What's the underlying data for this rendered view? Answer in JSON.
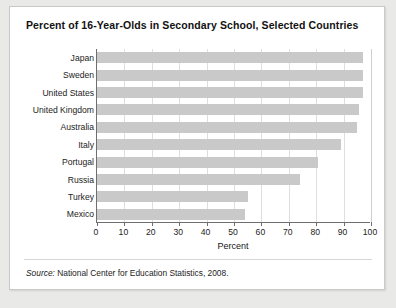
{
  "card": {
    "title": "Percent of 16-Year-Olds in Secondary School, Selected Countries",
    "source_label": "Source:",
    "source_text": " National Center for Education Statistics, 2008."
  },
  "colors": {
    "bar_fill": "#c9c9c9",
    "axis": "#6e6e6e",
    "gridline": "#dedede",
    "card_background": "#ffffff",
    "page_background": "#e9e9e7",
    "text": "#1c1c1c"
  },
  "chart_data": {
    "type": "bar",
    "orientation": "horizontal",
    "title": "Percent of 16-Year-Olds in Secondary School, Selected Countries",
    "xlabel": "Percent",
    "ylabel": "",
    "xlim": [
      0,
      100
    ],
    "xticks": [
      0,
      10,
      20,
      30,
      40,
      50,
      60,
      70,
      80,
      90,
      100
    ],
    "xticklabels": [
      "0",
      "10",
      "20",
      "30",
      "40",
      "50",
      "60",
      "70",
      "80",
      "90",
      "100"
    ],
    "grid": "vertical",
    "legend": "none",
    "categories": [
      "Japan",
      "Sweden",
      "United States",
      "United Kingdom",
      "Australia",
      "Italy",
      "Portugal",
      "Russia",
      "Turkey",
      "Mexico"
    ],
    "values": [
      97,
      97,
      97,
      95.5,
      95,
      89,
      80.5,
      74,
      55,
      54
    ],
    "source": "Source: National Center for Education Statistics, 2008."
  }
}
